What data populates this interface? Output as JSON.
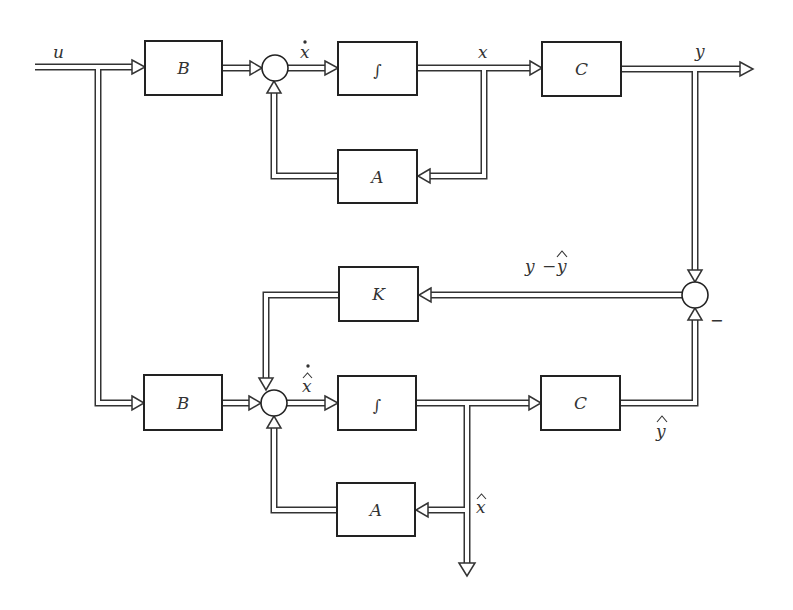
{
  "diagram": {
    "plant": {
      "blocks": {
        "B": "B",
        "integrator": "∫",
        "C": "C",
        "A": "A"
      },
      "signals": {
        "input": "u",
        "state_derivative": "ẋ",
        "state": "x",
        "output": "y"
      }
    },
    "observer": {
      "blocks": {
        "K": "K",
        "B": "B",
        "integrator": "∫",
        "C": "C",
        "A": "A"
      },
      "signals": {
        "error": "y − ŷ",
        "estimate_derivative": "x̂̇",
        "estimated_output": "ŷ",
        "estimated_state": "x̂"
      },
      "error_junction_sign": "−"
    }
  },
  "labels": {
    "u": "u",
    "x_dot_x": "x",
    "x": "x",
    "y": "y",
    "y_minus": "y",
    "minus_sep": "−",
    "yhat_base": "y",
    "hat": "^",
    "xhat_dot_x": "x",
    "yhat": "y",
    "xhat": "x",
    "minus": "−",
    "B1": "B",
    "int1": "∫",
    "C1": "C",
    "A1": "A",
    "K": "K",
    "B2": "B",
    "int2": "∫",
    "C2": "C",
    "A2": "A"
  }
}
